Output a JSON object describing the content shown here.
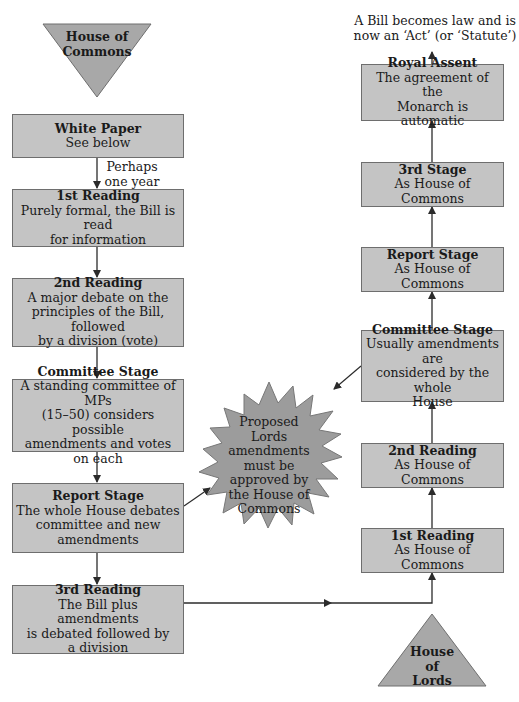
{
  "colors": {
    "box_fill": "#c4c4c4",
    "box_border": "#6e6e6e",
    "shape_fill": "#a8a8a8",
    "arrow": "#333333"
  },
  "commons": {
    "start_label": "House of\nCommons",
    "note": "Perhaps\none year",
    "stages": [
      {
        "title": "White Paper",
        "desc": "See below"
      },
      {
        "title": "1st Reading",
        "desc": "Purely formal, the Bill is read\nfor information"
      },
      {
        "title": "2nd Reading",
        "desc": "A major debate on the\nprinciples of the Bill, followed\nby a division (vote)"
      },
      {
        "title": "Committee Stage",
        "desc": "A standing committee of MPs\n(15–50) considers possible\namendments and votes on each"
      },
      {
        "title": "Report Stage",
        "desc": "The whole House debates\ncommittee and new\namendments"
      },
      {
        "title": "3rd Reading",
        "desc": "The Bill plus amendments\nis debated followed by\na division"
      }
    ]
  },
  "lords": {
    "start_label": "House\nof\nLords",
    "stages": [
      {
        "title": "1st Reading",
        "desc": "As House of Commons"
      },
      {
        "title": "2nd Reading",
        "desc": "As House of Commons"
      },
      {
        "title": "Committee Stage",
        "desc": "Usually amendments are\nconsidered by the whole\nHouse"
      },
      {
        "title": "Report Stage",
        "desc": "As House of Commons"
      },
      {
        "title": "3rd Stage",
        "desc": "As House of Commons"
      },
      {
        "title": "Royal Assent",
        "desc": "The agreement of the\nMonarch is automatic"
      }
    ],
    "outcome": "A Bill becomes law and is\nnow an ‘Act’ (or ‘Statute’)"
  },
  "starburst": {
    "text": "Proposed Lords\namendments\nmust be\napproved by\nthe House of\nCommons"
  }
}
